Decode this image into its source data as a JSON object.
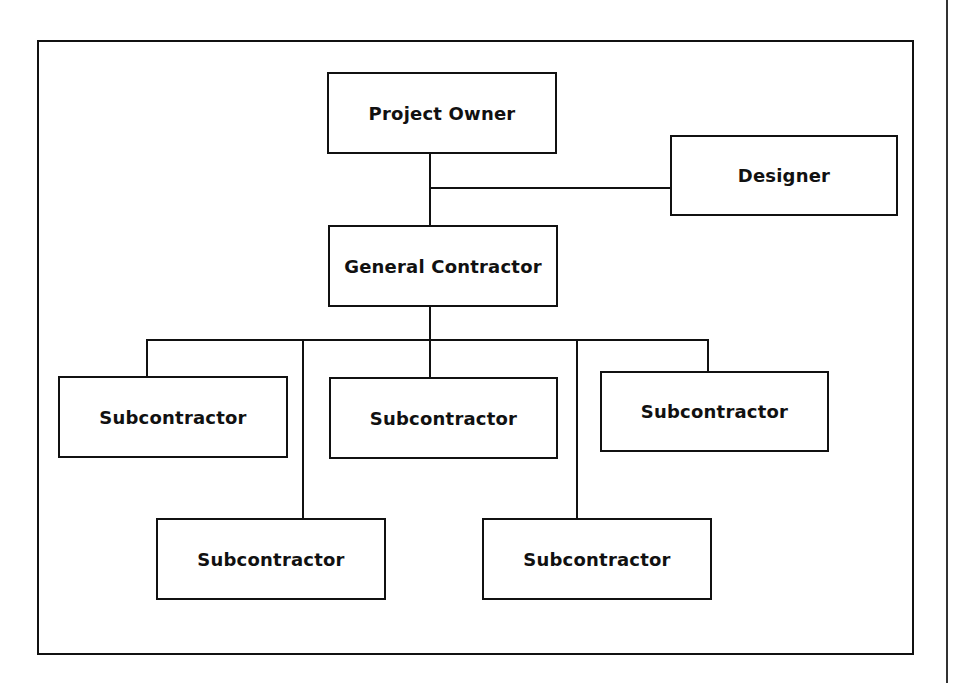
{
  "diagram": {
    "type": "organization-chart",
    "nodes": [
      {
        "id": "owner",
        "label": "Project Owner"
      },
      {
        "id": "designer",
        "label": "Designer"
      },
      {
        "id": "gc",
        "label": "General Contractor"
      },
      {
        "id": "sub1",
        "label": "Subcontractor"
      },
      {
        "id": "sub2",
        "label": "Subcontractor"
      },
      {
        "id": "sub3",
        "label": "Subcontractor"
      },
      {
        "id": "sub4",
        "label": "Subcontractor"
      },
      {
        "id": "sub5",
        "label": "Subcontractor"
      }
    ],
    "edges": [
      {
        "from": "owner",
        "to": "gc"
      },
      {
        "from": "owner",
        "to": "designer"
      },
      {
        "from": "gc",
        "to": "sub1"
      },
      {
        "from": "gc",
        "to": "sub2"
      },
      {
        "from": "gc",
        "to": "sub3"
      },
      {
        "from": "gc",
        "to": "sub4"
      },
      {
        "from": "gc",
        "to": "sub5"
      }
    ]
  }
}
